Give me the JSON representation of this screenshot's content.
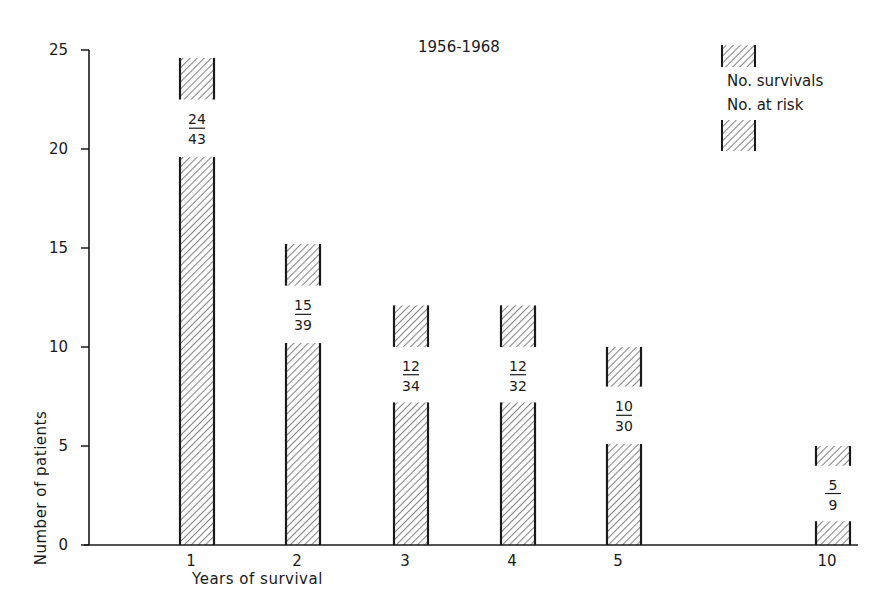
{
  "chart_data": {
    "type": "bar",
    "title": "1956-1968",
    "xlabel": "Years of survival",
    "ylabel": "Number of patients",
    "ylim": [
      0,
      25
    ],
    "yticks": [
      0,
      5,
      10,
      15,
      20,
      25
    ],
    "grid": false,
    "legend": {
      "position": "top-right",
      "entries": [
        "No. survivals",
        "No. at risk"
      ],
      "description": "Hatched bar split by fraction label: No. survivals / No. at risk"
    },
    "categories": [
      "1",
      "2",
      "3",
      "4",
      "5",
      "10"
    ],
    "series": [
      {
        "name": "No. survivals",
        "values": [
          24,
          15,
          12,
          12,
          10,
          5
        ]
      },
      {
        "name": "No. at risk",
        "values": [
          43,
          39,
          34,
          32,
          30,
          9
        ]
      }
    ],
    "bars": [
      {
        "year": "1",
        "survivals": "24",
        "at_risk": "43",
        "lower_top": 19.6,
        "cap_bottom": 22.5,
        "cap_top": 24.6
      },
      {
        "year": "2",
        "survivals": "15",
        "at_risk": "39",
        "lower_top": 10.2,
        "cap_bottom": 13.1,
        "cap_top": 15.2
      },
      {
        "year": "3",
        "survivals": "12",
        "at_risk": "34",
        "lower_top": 7.2,
        "cap_bottom": 10.0,
        "cap_top": 12.1
      },
      {
        "year": "4",
        "survivals": "12",
        "at_risk": "32",
        "lower_top": 7.2,
        "cap_bottom": 10.0,
        "cap_top": 12.1
      },
      {
        "year": "5",
        "survivals": "10",
        "at_risk": "30",
        "lower_top": 5.1,
        "cap_bottom": 8.0,
        "cap_top": 10.0
      },
      {
        "year": "10",
        "survivals": "5",
        "at_risk": "9",
        "lower_top": 1.2,
        "cap_bottom": 4.0,
        "cap_top": 5.0
      }
    ]
  },
  "colors": {
    "ink": "#1a1a1a",
    "background": "#ffffff"
  }
}
